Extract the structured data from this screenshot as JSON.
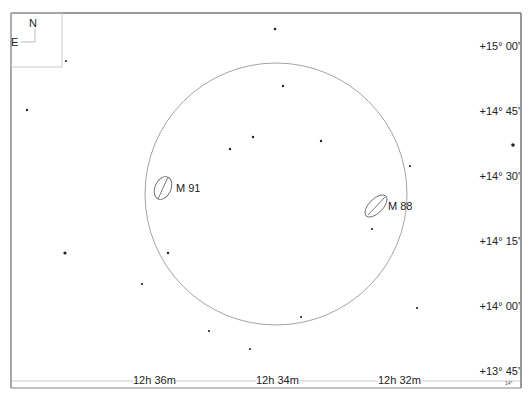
{
  "compass": {
    "north": "N",
    "east": "E"
  },
  "ra_labels": [
    {
      "text": "12h 36m",
      "x": 133
    },
    {
      "text": "12h 34m",
      "x": 256
    },
    {
      "text": "12h 32m",
      "x": 378
    }
  ],
  "dec_labels": [
    {
      "text": "+15° 00'",
      "y": 46
    },
    {
      "text": "+14° 45'",
      "y": 111
    },
    {
      "text": "+14° 30'",
      "y": 176
    },
    {
      "text": "+14° 15'",
      "y": 241
    },
    {
      "text": "+14° 00'",
      "y": 306
    },
    {
      "text": "+13° 45'",
      "y": 371
    }
  ],
  "dec_small_label": "14°",
  "objects": [
    {
      "name": "M 91",
      "label": "M 91",
      "x": 163,
      "y": 188
    },
    {
      "name": "M 88",
      "label": "M 88",
      "x": 376,
      "y": 206
    }
  ],
  "field_circle": {
    "cx": 276,
    "cy": 194,
    "r": 131
  },
  "stars": [
    {
      "x": 275,
      "y": 29,
      "r": 1.3
    },
    {
      "x": 66,
      "y": 61,
      "r": 1.1
    },
    {
      "x": 283,
      "y": 86,
      "r": 1.2
    },
    {
      "x": 27,
      "y": 110,
      "r": 1.2
    },
    {
      "x": 253,
      "y": 137,
      "r": 1.2
    },
    {
      "x": 321,
      "y": 141,
      "r": 1.2
    },
    {
      "x": 230,
      "y": 149,
      "r": 1.2
    },
    {
      "x": 513,
      "y": 145,
      "r": 1.8
    },
    {
      "x": 410,
      "y": 166,
      "r": 1.1
    },
    {
      "x": 372,
      "y": 229,
      "r": 1.1
    },
    {
      "x": 65,
      "y": 253,
      "r": 1.6
    },
    {
      "x": 168,
      "y": 253,
      "r": 1.2
    },
    {
      "x": 142,
      "y": 284,
      "r": 1.1
    },
    {
      "x": 417,
      "y": 308,
      "r": 1.1
    },
    {
      "x": 301,
      "y": 317,
      "r": 1.1
    },
    {
      "x": 209,
      "y": 331,
      "r": 1.1
    },
    {
      "x": 250,
      "y": 349,
      "r": 1.1
    }
  ]
}
